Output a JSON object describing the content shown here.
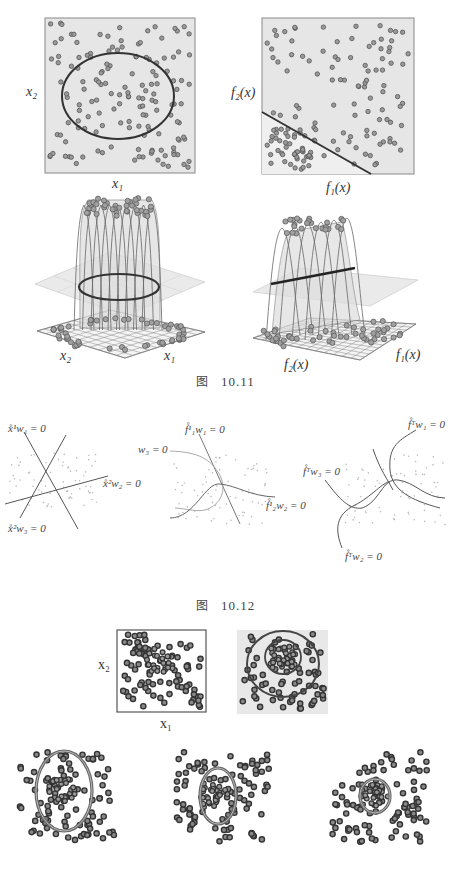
{
  "figure_10_11": {
    "caption_prefix": "图",
    "caption_number": "10.11",
    "panel_a": {
      "xlabel": "x₁",
      "ylabel": "x₂",
      "boundary": "ellipse"
    },
    "panel_b": {
      "xlabel": "f₁(x)",
      "ylabel": "f₂(x)",
      "boundary": "line"
    },
    "panel_c": {
      "xlabel": "x₁",
      "ylabel": "x₂",
      "type": "3d-surface-ellipse"
    },
    "panel_d": {
      "xlabel": "f₁(x)",
      "ylabel": "f₂(x)",
      "type": "3d-surface-line"
    }
  },
  "figure_10_12": {
    "caption_prefix": "图",
    "caption_number": "10.12",
    "panel_a": {
      "labels": [
        "x̊¹w₁ = 0",
        "x̊²w₂ = 0",
        "x̊²w₃ = 0"
      ]
    },
    "panel_b": {
      "labels": [
        "f̊¹₁w₁ = 0",
        "f̊¹₂w₂ = 0",
        "w₃ = 0"
      ]
    },
    "panel_c": {
      "labels": [
        "f̊ᵀw₁ = 0",
        "f̊ᵀw₃ = 0",
        "f̊ᵀw₂ = 0"
      ]
    }
  },
  "figure_10_13": {
    "panel_a": {
      "xlabel": "x₁",
      "ylabel": "x₂"
    }
  },
  "colors": {
    "panel_bg": "#e6e6e6",
    "panel_border": "#888888",
    "dot_fill": "#9a9a9a",
    "dot_stroke": "#555555",
    "curve": "#333333",
    "light_curve": "#aaaaaa"
  }
}
